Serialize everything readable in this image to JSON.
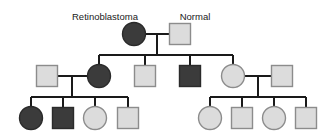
{
  "figure": {
    "type": "pedigree-chart",
    "background_color": "#ffffff"
  },
  "legend_labels": {
    "affected": "Retinoblastoma",
    "unaffected": "Normal"
  },
  "symbol_styles": {
    "affected_fill": "#3b3b3b",
    "affected_stroke": "#2a2a2a",
    "unaffected_fill": "#dcdcdc",
    "unaffected_stroke": "#8c8c8c",
    "line_color": "#1a1a1a"
  },
  "labels": [
    {
      "id": "label-retinoblastoma",
      "text": "Retinoblastoma",
      "x": 105,
      "y": 20
    },
    {
      "id": "label-normal",
      "text": "Normal",
      "x": 195,
      "y": 20
    }
  ],
  "generations": [
    {
      "id": "generation-1",
      "number": "I",
      "individuals": [
        {
          "id": "I-1",
          "shape": "circle",
          "status": "affected",
          "sex": "female",
          "cx": 134,
          "cy": 34,
          "r": 11.5
        },
        {
          "id": "I-2",
          "shape": "square",
          "status": "unaffected",
          "sex": "male",
          "cx": 180,
          "cy": 34,
          "size": 21
        }
      ]
    },
    {
      "id": "generation-2",
      "number": "II",
      "individuals": [
        {
          "id": "II-1",
          "shape": "square",
          "status": "unaffected",
          "sex": "male",
          "cx": 47,
          "cy": 76,
          "size": 21
        },
        {
          "id": "II-2",
          "shape": "circle",
          "status": "affected",
          "sex": "female",
          "cx": 99,
          "cy": 76,
          "r": 11.5
        },
        {
          "id": "II-3",
          "shape": "square",
          "status": "unaffected",
          "sex": "male",
          "cx": 145,
          "cy": 76,
          "size": 21
        },
        {
          "id": "II-4",
          "shape": "square",
          "status": "affected",
          "sex": "male",
          "cx": 190,
          "cy": 76,
          "size": 21
        },
        {
          "id": "II-5",
          "shape": "circle",
          "status": "unaffected",
          "sex": "female",
          "cx": 233,
          "cy": 76,
          "r": 11.5
        },
        {
          "id": "II-6",
          "shape": "square",
          "status": "unaffected",
          "sex": "male",
          "cx": 282,
          "cy": 76,
          "size": 21
        }
      ]
    },
    {
      "id": "generation-3",
      "number": "III",
      "individuals": [
        {
          "id": "III-1",
          "shape": "circle",
          "status": "affected",
          "sex": "female",
          "cx": 31,
          "cy": 118,
          "r": 11.5
        },
        {
          "id": "III-2",
          "shape": "square",
          "status": "affected",
          "sex": "male",
          "cx": 63,
          "cy": 118,
          "size": 21
        },
        {
          "id": "III-3",
          "shape": "circle",
          "status": "unaffected",
          "sex": "female",
          "cx": 95,
          "cy": 118,
          "r": 11.5
        },
        {
          "id": "III-4",
          "shape": "square",
          "status": "unaffected",
          "sex": "male",
          "cx": 128,
          "cy": 118,
          "size": 21
        },
        {
          "id": "III-5",
          "shape": "circle",
          "status": "unaffected",
          "sex": "female",
          "cx": 210,
          "cy": 118,
          "r": 11.5
        },
        {
          "id": "III-6",
          "shape": "square",
          "status": "unaffected",
          "sex": "male",
          "cx": 242,
          "cy": 118,
          "size": 21
        },
        {
          "id": "III-7",
          "shape": "circle",
          "status": "unaffected",
          "sex": "female",
          "cx": 274,
          "cy": 118,
          "r": 11.5
        },
        {
          "id": "III-8",
          "shape": "square",
          "status": "unaffected",
          "sex": "male",
          "cx": 306,
          "cy": 118,
          "size": 21
        }
      ]
    }
  ],
  "connectors": {
    "mating_lines": [
      {
        "id": "mating-I",
        "x1": 146,
        "y1": 34,
        "x2": 169,
        "y2": 34
      },
      {
        "id": "mating-II-left",
        "x1": 58,
        "y1": 76,
        "x2": 87,
        "y2": 76
      },
      {
        "id": "mating-II-right",
        "x1": 245,
        "y1": 76,
        "x2": 271,
        "y2": 76
      }
    ],
    "descent_lines": [
      {
        "id": "descent-I",
        "x1": 157,
        "y1": 34,
        "x2": 157,
        "y2": 55
      },
      {
        "id": "descent-II-left",
        "x1": 72,
        "y1": 76,
        "x2": 72,
        "y2": 97
      },
      {
        "id": "descent-II-right",
        "x1": 258,
        "y1": 76,
        "x2": 258,
        "y2": 97
      }
    ],
    "sibship_bars": [
      {
        "id": "sibship-II",
        "x1": 99,
        "y1": 55,
        "x2": 233,
        "y2": 55
      },
      {
        "id": "sibship-III-left",
        "x1": 31,
        "y1": 97,
        "x2": 128,
        "y2": 97
      },
      {
        "id": "sibship-III-right",
        "x1": 210,
        "y1": 97,
        "x2": 306,
        "y2": 97
      }
    ],
    "drop_lines": [
      {
        "id": "drop-II-1",
        "x1": 99,
        "y1": 55,
        "x2": 99,
        "y2": 65
      },
      {
        "id": "drop-II-2",
        "x1": 145,
        "y1": 55,
        "x2": 145,
        "y2": 65
      },
      {
        "id": "drop-II-3",
        "x1": 190,
        "y1": 55,
        "x2": 190,
        "y2": 65
      },
      {
        "id": "drop-II-4",
        "x1": 233,
        "y1": 55,
        "x2": 233,
        "y2": 65
      },
      {
        "id": "drop-III-1",
        "x1": 31,
        "y1": 97,
        "x2": 31,
        "y2": 107
      },
      {
        "id": "drop-III-2",
        "x1": 63,
        "y1": 97,
        "x2": 63,
        "y2": 107
      },
      {
        "id": "drop-III-3",
        "x1": 95,
        "y1": 97,
        "x2": 95,
        "y2": 107
      },
      {
        "id": "drop-III-4",
        "x1": 128,
        "y1": 97,
        "x2": 128,
        "y2": 107
      },
      {
        "id": "drop-III-5",
        "x1": 210,
        "y1": 97,
        "x2": 210,
        "y2": 107
      },
      {
        "id": "drop-III-6",
        "x1": 242,
        "y1": 97,
        "x2": 242,
        "y2": 107
      },
      {
        "id": "drop-III-7",
        "x1": 274,
        "y1": 97,
        "x2": 274,
        "y2": 107
      },
      {
        "id": "drop-III-8",
        "x1": 306,
        "y1": 97,
        "x2": 306,
        "y2": 107
      }
    ],
    "label_leader_lines": []
  }
}
